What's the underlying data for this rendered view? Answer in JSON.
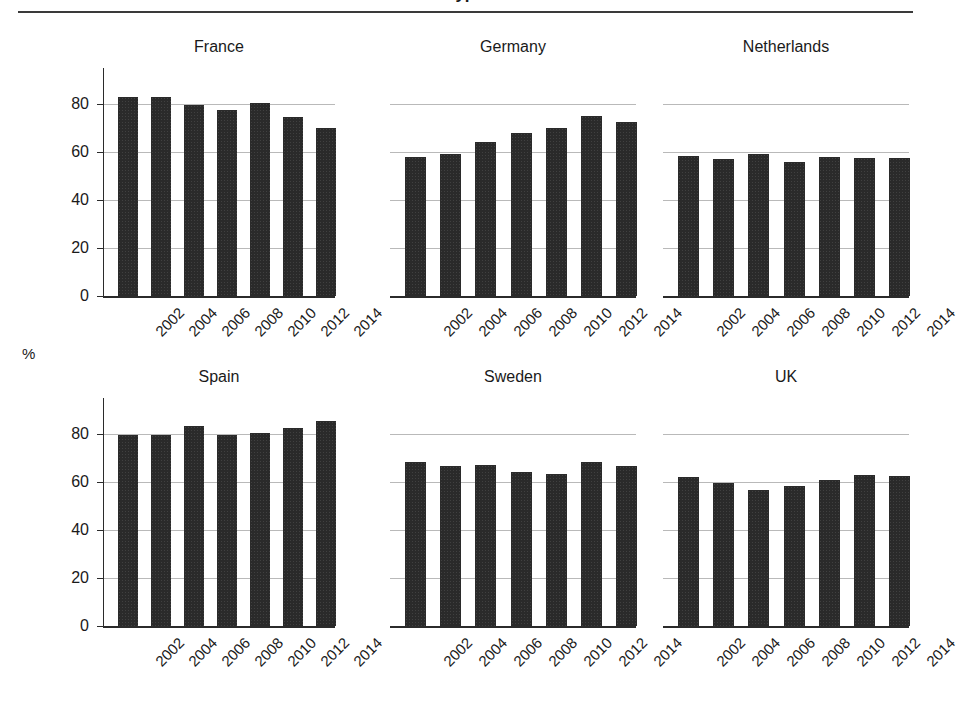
{
  "figure": {
    "title_fragment": "Type",
    "unit_label": "%"
  },
  "chart_data": {
    "type": "bar",
    "title": "",
    "xlabel": "",
    "ylabel": "%",
    "ylim": [
      0,
      95
    ],
    "yticks": [
      0,
      20,
      40,
      60,
      80
    ],
    "ytick_labels": [
      "0",
      "20",
      "40",
      "60",
      "80"
    ],
    "grid": true,
    "legend": "none",
    "categories": [
      "2002",
      "2004",
      "2006",
      "2008",
      "2010",
      "2012",
      "2014"
    ],
    "panels": [
      {
        "name": "France",
        "values": [
          83.0,
          83.0,
          79.5,
          77.5,
          80.5,
          74.5,
          70.0
        ],
        "show_axis": true
      },
      {
        "name": "Germany",
        "values": [
          58.0,
          59.0,
          64.0,
          68.0,
          70.0,
          75.0,
          72.5
        ],
        "show_axis": false
      },
      {
        "name": "Netherlands",
        "values": [
          58.5,
          57.0,
          59.0,
          56.0,
          58.0,
          57.5,
          57.5
        ],
        "show_axis": false
      },
      {
        "name": "Spain",
        "values": [
          79.5,
          79.5,
          83.5,
          79.5,
          80.5,
          82.5,
          85.5
        ],
        "show_axis": true
      },
      {
        "name": "Sweden",
        "values": [
          68.5,
          66.5,
          67.0,
          64.0,
          63.5,
          68.5,
          66.5
        ],
        "show_axis": false
      },
      {
        "name": "UK",
        "values": [
          62.0,
          59.5,
          56.5,
          58.5,
          61.0,
          63.0,
          62.5
        ],
        "show_axis": false
      }
    ]
  }
}
